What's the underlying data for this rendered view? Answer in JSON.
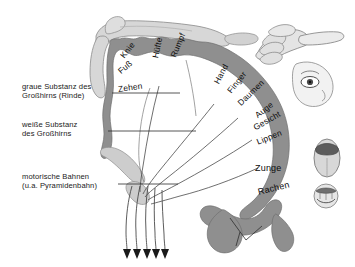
{
  "figure": {
    "language": "de"
  },
  "colors": {
    "cortex_grey": "#8f8f8f",
    "cortex_grey_dark": "#7d7d7d",
    "white_matter": "#fdfdfd",
    "limb_fill": "#cfcfcf",
    "limb_fill_light": "#dedede",
    "line": "#3b3b3b",
    "leader": "#2b2b2b",
    "text": "#111111",
    "background": "#ffffff"
  },
  "annotations": [
    {
      "name": "grey-matter",
      "line1": "graue Substanz des",
      "line2": "Großhirns (Rinde)"
    },
    {
      "name": "white-matter",
      "line1": "weiße Substanz",
      "line2": "des Großhirns"
    },
    {
      "name": "motor-tracts",
      "line1": "motorische Bahnen",
      "line2": "(u.a. Pyramidenbahn)"
    }
  ],
  "cortex_labels": [
    {
      "text": "Knie",
      "x": 122,
      "y": 52,
      "rot": -52
    },
    {
      "text": "Fuß",
      "x": 119,
      "y": 67,
      "rot": -40
    },
    {
      "text": "Zehen",
      "x": 118,
      "y": 84,
      "rot": -8
    },
    {
      "text": "Hüfte",
      "x": 155,
      "y": 53,
      "rot": -78
    },
    {
      "text": "Rumpf",
      "x": 173,
      "y": 52,
      "rot": -68
    },
    {
      "text": "Hand",
      "x": 216,
      "y": 78,
      "rot": -62
    },
    {
      "text": "Finger",
      "x": 229,
      "y": 87,
      "rot": -52
    },
    {
      "text": "Daumen",
      "x": 239,
      "y": 99,
      "rot": -44
    },
    {
      "text": "Auge",
      "x": 256,
      "y": 111,
      "rot": -38
    },
    {
      "text": "Gesicht",
      "x": 254,
      "y": 123,
      "rot": -30
    },
    {
      "text": "Lippen",
      "x": 257,
      "y": 137,
      "rot": -22
    },
    {
      "text": "Zunge",
      "x": 255,
      "y": 163,
      "rot": 0,
      "big": true
    },
    {
      "text": "Rachen",
      "x": 258,
      "y": 187,
      "rot": -14,
      "big": true
    }
  ],
  "illustrations": [
    {
      "name": "leg-limb-figure",
      "desc": "Bein über dem Scheitel"
    },
    {
      "name": "pointing-hand",
      "desc": "zeigende Hand oben rechts"
    },
    {
      "name": "face-eye",
      "desc": "Gesicht mit Auge"
    },
    {
      "name": "tongue",
      "desc": "Zunge"
    },
    {
      "name": "mouth-throat",
      "desc": "Mund und Rachen"
    }
  ],
  "tracts": {
    "count": 5,
    "arrowheads": 5
  }
}
